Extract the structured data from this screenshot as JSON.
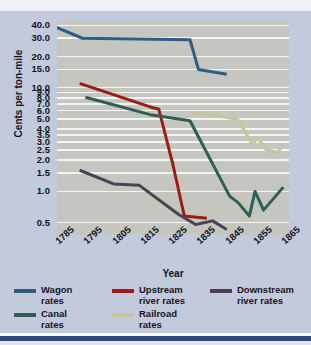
{
  "figure": {
    "background": "#c3cadb",
    "plot_background": "#c6c6c0",
    "gridline_color": "#f4f4f2",
    "accent_rule": "#2e4a7d",
    "top_ghost_text": "··  ···"
  },
  "chart_data": {
    "type": "line",
    "title": "",
    "xlabel": "Year",
    "ylabel": "Cents per ton-mile",
    "yscale": "log",
    "grid": true,
    "legend_position": "bottom",
    "x_tick_labels": [
      "1785",
      "1795",
      "1805",
      "1815",
      "1825",
      "1835",
      "1845",
      "1855",
      "1865"
    ],
    "y_tick_labels": [
      "40.0",
      "30.0",
      "20.0",
      "15.0",
      "10.0",
      "9.0",
      "8.0",
      "7.0",
      "6.0",
      "5.0",
      "4.0",
      "3.5",
      "3.0",
      "2.5",
      "2.0",
      "1.5",
      "1.0",
      "0.5"
    ],
    "y_tick_values": [
      40.0,
      30.0,
      20.0,
      15.0,
      10.0,
      9.0,
      8.0,
      7.0,
      6.0,
      5.0,
      4.0,
      3.5,
      3.0,
      2.5,
      2.0,
      1.5,
      1.0,
      0.5
    ],
    "xlim": [
      1785,
      1867
    ],
    "ylim": [
      0.38,
      44
    ],
    "series": [
      {
        "name": "Wagon rates",
        "color": "#2d5d86",
        "points": [
          [
            1785,
            38.0
          ],
          [
            1794,
            30.0
          ],
          [
            1832,
            29.0
          ],
          [
            1835,
            15.0
          ],
          [
            1845,
            13.5
          ]
        ]
      },
      {
        "name": "Upstream river rates",
        "color": "#9b1c14",
        "points": [
          [
            1793,
            11.0
          ],
          [
            1819,
            6.4
          ],
          [
            1821,
            6.2
          ],
          [
            1826,
            1.8
          ],
          [
            1830,
            0.58
          ],
          [
            1838,
            0.55
          ]
        ]
      },
      {
        "name": "Downstream river rates",
        "color": "#4a4252",
        "points": [
          [
            1793,
            1.6
          ],
          [
            1805,
            1.18
          ],
          [
            1814,
            1.15
          ],
          [
            1828,
            0.6
          ],
          [
            1834,
            0.48
          ],
          [
            1840,
            0.52
          ],
          [
            1845,
            0.43
          ]
        ]
      },
      {
        "name": "Canal rates",
        "color": "#2d5f56",
        "points": [
          [
            1795,
            8.1
          ],
          [
            1818,
            5.5
          ],
          [
            1832,
            4.8
          ],
          [
            1846,
            0.9
          ],
          [
            1849,
            0.78
          ],
          [
            1853,
            0.58
          ],
          [
            1855,
            1.0
          ],
          [
            1858,
            0.66
          ],
          [
            1865,
            1.1
          ]
        ]
      },
      {
        "name": "Railroad rates",
        "color": "#c8c49b",
        "points": [
          [
            1833,
            5.7
          ],
          [
            1845,
            5.2
          ],
          [
            1849,
            4.9
          ],
          [
            1854,
            2.85
          ],
          [
            1856,
            3.3
          ],
          [
            1859,
            2.5
          ],
          [
            1861,
            2.45
          ],
          [
            1863,
            2.38
          ],
          [
            1865,
            2.8
          ]
        ]
      }
    ]
  },
  "legend": {
    "items": [
      {
        "label": "Wagon\nrates",
        "color": "#2d5d86"
      },
      {
        "label": "Upstream\nriver rates",
        "color": "#9b1c14"
      },
      {
        "label": "Downstream\nriver rates",
        "color": "#4a4252"
      },
      {
        "label": "Canal\nrates",
        "color": "#2d5f56"
      },
      {
        "label": "Railroad\nrates",
        "color": "#c8c49b"
      }
    ]
  }
}
